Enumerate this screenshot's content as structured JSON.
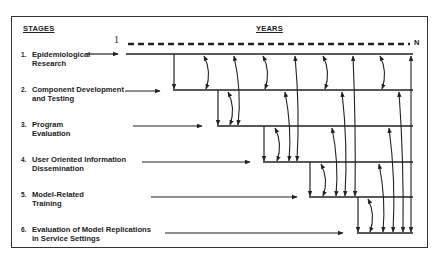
{
  "headers": {
    "stages": "STAGES",
    "years": "YEARS"
  },
  "axis": {
    "start": "1",
    "end": "N"
  },
  "stages": [
    {
      "num": "1.",
      "line1": "Epidemiological",
      "line2": "Research"
    },
    {
      "num": "2.",
      "line1": "Component Development",
      "line2": "and Testing"
    },
    {
      "num": "3.",
      "line1": "Program",
      "line2": "Evaluation"
    },
    {
      "num": "4.",
      "line1": "User Oriented Information",
      "line2": "Dissemination"
    },
    {
      "num": "5.",
      "line1": "Model-Related",
      "line2": "Training"
    },
    {
      "num": "6.",
      "line1": "Evaluation of Model Replications",
      "line2": "in Service Settings"
    }
  ],
  "colors": {
    "line": "#222222",
    "background": "#ffffff"
  }
}
